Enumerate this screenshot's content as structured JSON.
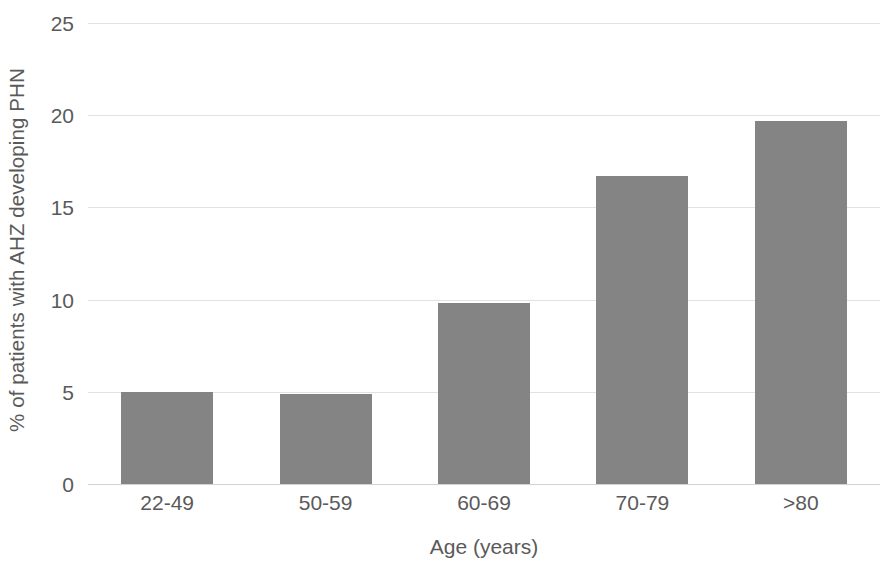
{
  "chart_data": {
    "type": "bar",
    "title": "",
    "xlabel": "Age (years)",
    "ylabel": "% of patients with AHZ developing PHN",
    "categories": [
      "22-49",
      "50-59",
      "60-69",
      "70-79",
      ">80"
    ],
    "values": [
      5.0,
      4.9,
      9.8,
      16.7,
      19.7
    ],
    "ylim": [
      0,
      25
    ],
    "yticks": [
      0,
      5,
      10,
      15,
      20,
      25
    ],
    "ytick_labels": [
      "0",
      "5",
      "10",
      "15",
      "20",
      "25"
    ],
    "grid": true,
    "legend": false,
    "series": [
      {
        "name": "% of patients with AHZ developing PHN",
        "values": [
          5.0,
          4.9,
          9.8,
          16.7,
          19.7
        ]
      }
    ],
    "colors": {
      "bar_fill": "#848484",
      "gridline": "#e2e2e2",
      "baseline": "#d2d2d2",
      "text": "#5a5a5a",
      "background": "#ffffff"
    }
  }
}
